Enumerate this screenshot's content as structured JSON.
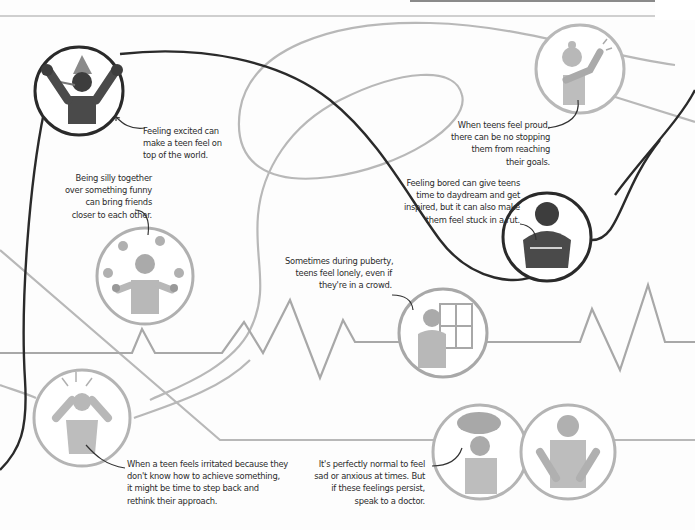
{
  "page": {
    "style": {
      "dark_line_color": "#2a2a2a",
      "light_line_color": "#b4b4b4",
      "dark_figure_color": "#3d3d3d",
      "light_figure_color": "#b0b0b0",
      "background": "#fdfdfd"
    },
    "emotions": [
      {
        "id": "excited",
        "caption_lines": [
          "Feeling excited can",
          "make a teen feel on",
          "top of the world."
        ],
        "icon": "party-hat-teen-icon",
        "tone": "dark"
      },
      {
        "id": "silly",
        "caption_lines": [
          "Being silly together",
          "over something funny",
          "can bring friends",
          "closer to each other."
        ],
        "icon": "juggling-teen-icon",
        "tone": "light"
      },
      {
        "id": "proud",
        "caption_lines": [
          "When teens feel proud,",
          "there can be no stopping",
          "them from reaching",
          "their goals."
        ],
        "icon": "proud-teen-icon",
        "tone": "light"
      },
      {
        "id": "bored",
        "caption_lines": [
          "Feeling bored can give teens",
          "time to daydream and get",
          "inspired, but it can also make",
          "them feel stuck in a rut."
        ],
        "icon": "bored-teen-icon",
        "tone": "dark"
      },
      {
        "id": "lonely",
        "caption_lines": [
          "Sometimes during puberty,",
          "teens feel lonely, even if",
          "they're in a crowd."
        ],
        "icon": "lonely-teen-window-icon",
        "tone": "light"
      },
      {
        "id": "irritated",
        "caption_lines": [
          "When a teen feels irritated because they",
          "don't know how to achieve something,",
          "it might be time to step back and",
          "rethink their approach."
        ],
        "icon": "irritated-teen-icon",
        "tone": "light"
      },
      {
        "id": "sad",
        "caption_lines": [
          "It's perfectly normal to feel",
          "sad or anxious at times. But",
          "if these feelings persist,",
          "speak to a doctor."
        ],
        "icon": "sad-cloud-teen-icon",
        "tone": "light"
      },
      {
        "id": "anxious",
        "caption_lines": [],
        "icon": "anxious-teen-icon",
        "tone": "light"
      }
    ]
  }
}
